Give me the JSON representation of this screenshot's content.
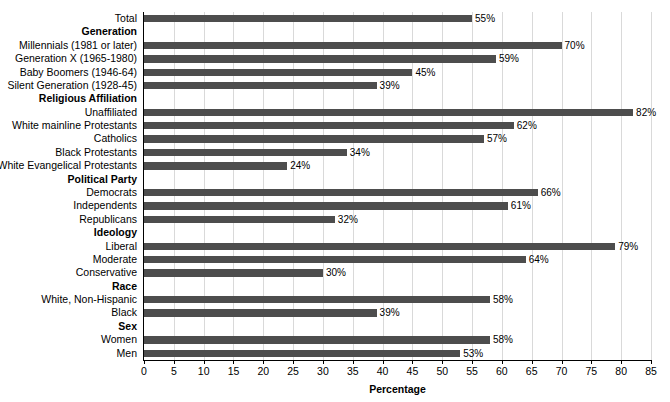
{
  "top_clipped_text": "",
  "chart_data": {
    "type": "bar",
    "orientation": "horizontal",
    "title": "",
    "xlabel": "Percentage",
    "ylabel": "",
    "xlim": [
      0,
      85
    ],
    "xticks": [
      0,
      5,
      10,
      15,
      20,
      25,
      30,
      35,
      40,
      45,
      50,
      55,
      60,
      65,
      70,
      75,
      80,
      85
    ],
    "xtick_labels": [
      "0",
      "5",
      "10",
      "15",
      "20",
      "25",
      "30",
      "35",
      "40",
      "45",
      "50",
      "55",
      "60",
      "65",
      "70",
      "75",
      "80",
      "85"
    ],
    "grid": "vertical",
    "legend": "none",
    "bar_color": "#4d4d4d",
    "value_suffix": "%",
    "rows": [
      {
        "kind": "bar",
        "label": "Total",
        "value": 55,
        "value_label": "55%"
      },
      {
        "kind": "header",
        "label": "Generation",
        "value": null,
        "value_label": ""
      },
      {
        "kind": "bar",
        "label": "Millennials (1981 or later)",
        "value": 70,
        "value_label": "70%"
      },
      {
        "kind": "bar",
        "label": "Generation X (1965-1980)",
        "value": 59,
        "value_label": "59%"
      },
      {
        "kind": "bar",
        "label": "Baby Boomers (1946-64)",
        "value": 45,
        "value_label": "45%"
      },
      {
        "kind": "bar",
        "label": "Silent Generation (1928-45)",
        "value": 39,
        "value_label": "39%"
      },
      {
        "kind": "header",
        "label": "Religious Affiliation",
        "value": null,
        "value_label": ""
      },
      {
        "kind": "bar",
        "label": "Unaffiliated",
        "value": 82,
        "value_label": "82%"
      },
      {
        "kind": "bar",
        "label": "White mainline Protestants",
        "value": 62,
        "value_label": "62%"
      },
      {
        "kind": "bar",
        "label": "Catholics",
        "value": 57,
        "value_label": "57%"
      },
      {
        "kind": "bar",
        "label": "Black Protestants",
        "value": 34,
        "value_label": "34%"
      },
      {
        "kind": "bar",
        "label": "White Evangelical Protestants",
        "value": 24,
        "value_label": "24%"
      },
      {
        "kind": "header",
        "label": "Political Party",
        "value": null,
        "value_label": ""
      },
      {
        "kind": "bar",
        "label": "Democrats",
        "value": 66,
        "value_label": "66%"
      },
      {
        "kind": "bar",
        "label": "Independents",
        "value": 61,
        "value_label": "61%"
      },
      {
        "kind": "bar",
        "label": "Republicans",
        "value": 32,
        "value_label": "32%"
      },
      {
        "kind": "header",
        "label": "Ideology",
        "value": null,
        "value_label": ""
      },
      {
        "kind": "bar",
        "label": "Liberal",
        "value": 79,
        "value_label": "79%"
      },
      {
        "kind": "bar",
        "label": "Moderate",
        "value": 64,
        "value_label": "64%"
      },
      {
        "kind": "bar",
        "label": "Conservative",
        "value": 30,
        "value_label": "30%"
      },
      {
        "kind": "header",
        "label": "Race",
        "value": null,
        "value_label": ""
      },
      {
        "kind": "bar",
        "label": "White, Non-Hispanic",
        "value": 58,
        "value_label": "58%"
      },
      {
        "kind": "bar",
        "label": "Black",
        "value": 39,
        "value_label": "39%"
      },
      {
        "kind": "header",
        "label": "Sex",
        "value": null,
        "value_label": ""
      },
      {
        "kind": "bar",
        "label": "Women",
        "value": 58,
        "value_label": "58%"
      },
      {
        "kind": "bar",
        "label": "Men",
        "value": 53,
        "value_label": "53%"
      }
    ]
  }
}
